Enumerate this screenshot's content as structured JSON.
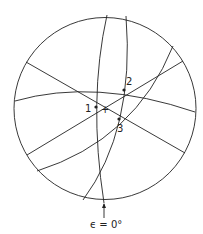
{
  "diagram": {
    "type": "stereographic-projection",
    "points": [
      {
        "id": "1",
        "label": "1"
      },
      {
        "id": "2",
        "label": "2"
      },
      {
        "id": "3",
        "label": "3"
      }
    ],
    "center_marker": "+",
    "caption": "ϵ = 0°",
    "colors": {
      "line": "#222222",
      "background": "#ffffff"
    }
  }
}
